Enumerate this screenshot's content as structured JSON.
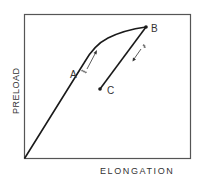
{
  "diagram": {
    "type": "preload-elongation curve",
    "y_axis_label": "PRELOAD",
    "x_axis_label": "ELONGATION",
    "points": [
      {
        "id": "A",
        "label": "A"
      },
      {
        "id": "B",
        "label": "B"
      },
      {
        "id": "C",
        "label": "C"
      }
    ],
    "line_color": "#1a1a1a",
    "frame_color": "#555555"
  }
}
